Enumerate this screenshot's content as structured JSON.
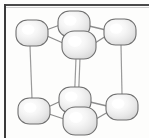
{
  "figure": {
    "panel_background": "#fdfdfc",
    "rule_color": "#3b3b3b",
    "bond_color": "#8c8c8c",
    "atom_outline_color": "#6f6f6f",
    "atom_fill_light": "#ffffff",
    "atom_fill_shade": "#e2e2e2"
  },
  "lattice": {
    "atom_count": 8,
    "bond_count": 12,
    "atoms": [
      {
        "id": "top-rear-left",
        "label": "atom-top-rear-left",
        "cx": 32,
        "cy": 33,
        "rx": 16,
        "ry": 13,
        "layer": 2
      },
      {
        "id": "top-rear-center",
        "label": "atom-top-rear-center",
        "cx": 74,
        "cy": 24,
        "rx": 16,
        "ry": 13,
        "layer": 1
      },
      {
        "id": "top-rear-right",
        "label": "atom-top-rear-right",
        "cx": 120,
        "cy": 32,
        "rx": 16,
        "ry": 13,
        "layer": 2
      },
      {
        "id": "top-front",
        "label": "atom-top-front",
        "cx": 79,
        "cy": 45,
        "rx": 17,
        "ry": 14,
        "layer": 3
      },
      {
        "id": "bottom-rear",
        "label": "atom-bottom-rear",
        "cx": 75,
        "cy": 100,
        "rx": 16,
        "ry": 13,
        "layer": 1
      },
      {
        "id": "bottom-left",
        "label": "atom-bottom-left",
        "cx": 34,
        "cy": 111,
        "rx": 16,
        "ry": 13,
        "layer": 2
      },
      {
        "id": "bottom-right",
        "label": "atom-bottom-right",
        "cx": 122,
        "cy": 107,
        "rx": 16,
        "ry": 13,
        "layer": 2
      },
      {
        "id": "bottom-front",
        "label": "atom-bottom-front",
        "cx": 80,
        "cy": 121,
        "rx": 17,
        "ry": 14,
        "layer": 3
      }
    ],
    "bonds": [
      {
        "id": "top-left-to-rear",
        "x1": 46,
        "y1": 30,
        "x2": 60,
        "y2": 25
      },
      {
        "id": "top-rear-to-right",
        "x1": 89,
        "y1": 26,
        "x2": 106,
        "y2": 30
      },
      {
        "id": "top-left-to-front",
        "x1": 47,
        "y1": 36,
        "x2": 63,
        "y2": 43
      },
      {
        "id": "top-front-to-right",
        "x1": 95,
        "y1": 43,
        "x2": 106,
        "y2": 36
      },
      {
        "id": "bottom-left-to-rear",
        "x1": 48,
        "y1": 107,
        "x2": 61,
        "y2": 101
      },
      {
        "id": "bottom-rear-to-right",
        "x1": 90,
        "y1": 102,
        "x2": 107,
        "y2": 106
      },
      {
        "id": "bottom-left-to-front",
        "x1": 49,
        "y1": 114,
        "x2": 64,
        "y2": 119
      },
      {
        "id": "bottom-front-to-right",
        "x1": 96,
        "y1": 119,
        "x2": 108,
        "y2": 112
      },
      {
        "id": "vert-left",
        "x1": 30,
        "y1": 46,
        "x2": 32,
        "y2": 99
      },
      {
        "id": "vert-right",
        "x1": 121,
        "y1": 45,
        "x2": 122,
        "y2": 94
      },
      {
        "id": "vert-center-a",
        "x1": 76,
        "y1": 58,
        "x2": 74,
        "y2": 109
      },
      {
        "id": "vert-center-b",
        "x1": 80,
        "y1": 58,
        "x2": 78,
        "y2": 109
      },
      {
        "id": "vert-rear-top",
        "x1": 74,
        "y1": 12,
        "x2": 74,
        "y2": 12
      }
    ]
  }
}
